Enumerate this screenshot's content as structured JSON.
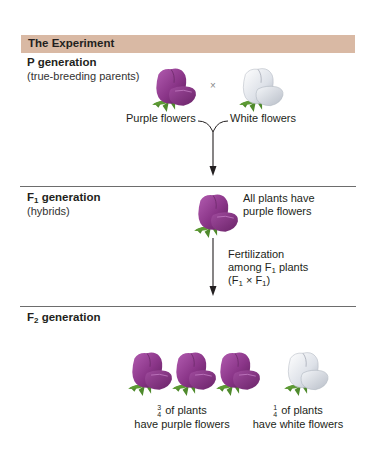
{
  "header": {
    "title": "The Experiment",
    "bar_color": "#d9b9a4"
  },
  "p_generation": {
    "title": "P generation",
    "subtitle": "(true-breeding parents)",
    "cross_symbol": "×",
    "parents": [
      {
        "label": "Purple flowers",
        "icon": "purple-flower-icon",
        "color": "#8e3a8c"
      },
      {
        "label": "White flowers",
        "icon": "white-flower-icon",
        "color": "#dfe3ea"
      }
    ]
  },
  "f1_generation": {
    "title_main": "F",
    "title_sub": "1",
    "title_rest": " generation",
    "subtitle": "(hybrids)",
    "result_line1": "All plants have",
    "result_line2": "purple flowers",
    "fertilization": {
      "line1": "Fertilization",
      "line2_pre": "among F",
      "line2_sub": "1",
      "line2_post": " plants",
      "line3_a": "(F",
      "line3_sub1": "1",
      "line3_mid": " × F",
      "line3_sub2": "1",
      "line3_end": ")"
    }
  },
  "f2_generation": {
    "title_main": "F",
    "title_sub": "2",
    "title_rest": " generation",
    "purple_count": 3,
    "white_count": 1,
    "purple_result": {
      "num": "3",
      "den": "4",
      "line1": " of plants",
      "line2": "have purple flowers"
    },
    "white_result": {
      "num": "1",
      "den": "4",
      "line1": " of plants",
      "line2": "have white flowers"
    }
  }
}
